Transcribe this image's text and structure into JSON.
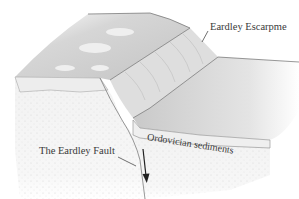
{
  "diagram": {
    "type": "geologic block diagram",
    "labels": {
      "escarpment": "Eardley Escarpme",
      "fault": "The Eardley Fault",
      "sediments": "Ordovician sediments"
    },
    "colors": {
      "upper_plateau": "#cfcfcf",
      "escarpment_face": "#dcdcdc",
      "lower_plateau": "#d4d4d4",
      "sediment_band": "#ececec",
      "stippled_ground": "#f4f4f4",
      "outline": "#6b6b6b",
      "arrow": "#222222"
    },
    "arrow": {
      "direction": "down",
      "meaning": "fault downthrow"
    }
  }
}
